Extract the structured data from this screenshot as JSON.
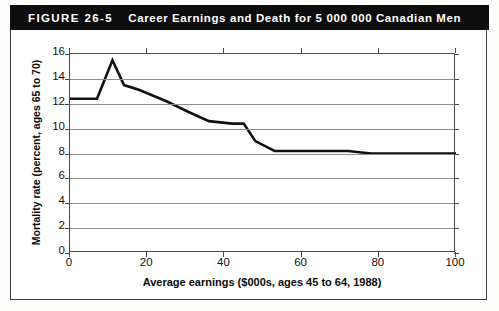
{
  "figure": {
    "number": "FIGURE 26-5",
    "title": "Career Earnings and Death for 5 000 000 Canadian Men"
  },
  "chart_data": {
    "type": "line",
    "title": "Career Earnings and Death for 5 000 000 Canadian Men",
    "xlabel": "Average earnings ($000s, ages 45 to 64, 1988)",
    "ylabel": "Mortality rate (percent, ages 65 to 70)",
    "xlim": [
      0,
      100
    ],
    "ylim": [
      0,
      16
    ],
    "xticks": [
      0,
      20,
      40,
      60,
      80,
      100
    ],
    "yticks": [
      0,
      2,
      4,
      6,
      8,
      10,
      12,
      14,
      16
    ],
    "grid": "horizontal",
    "legend": "none",
    "series": [
      {
        "name": "Mortality rate",
        "x": [
          0,
          7,
          11,
          14,
          18,
          25,
          31,
          36,
          42,
          45,
          48,
          53,
          63,
          72,
          78,
          100
        ],
        "y": [
          12.4,
          12.4,
          15.5,
          13.5,
          13.1,
          12.2,
          11.3,
          10.6,
          10.4,
          10.4,
          9.0,
          8.2,
          8.2,
          8.2,
          8.0,
          8.0
        ]
      }
    ]
  },
  "axes": {
    "y_tick_labels": [
      "0",
      "2",
      "4",
      "6",
      "8",
      "10",
      "12",
      "14",
      "16"
    ],
    "x_tick_labels": [
      "0",
      "20",
      "40",
      "60",
      "80",
      "100"
    ],
    "x_axis_title": "Average earnings ($000s, ages 45 to 64, 1988)",
    "y_axis_title": "Mortality rate (percent, ages 65 to 70)"
  },
  "colors": {
    "title_bar_bg": "#0d0d0d",
    "title_bar_text": "#ffffff",
    "plot_line": "#111111",
    "gridline": "#8e8e8e",
    "frame": "#3b3b3b",
    "page_bg": "#ffffff"
  }
}
